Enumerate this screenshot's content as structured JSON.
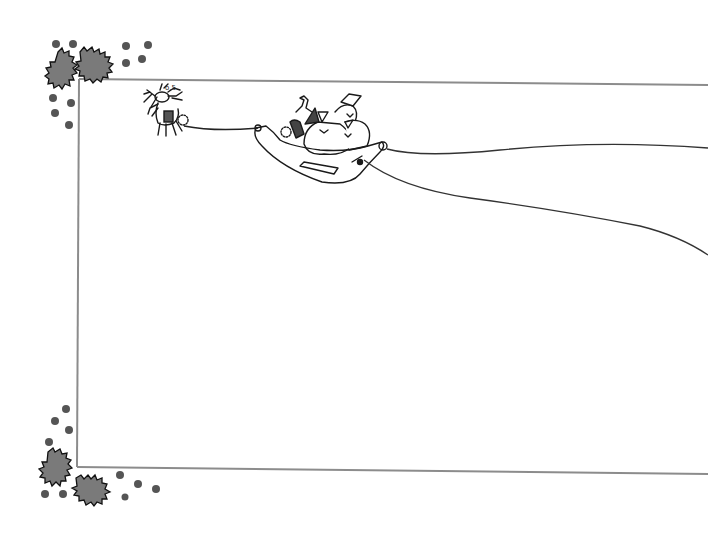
{
  "scene": {
    "title": "",
    "description_visible_text": [],
    "background": "#ffffff",
    "frame": {
      "stroke_color": "#8c8c8c",
      "top_left": [
        79,
        79
      ],
      "top_right": [
        708,
        85
      ],
      "bottom_left": [
        77,
        467
      ],
      "bottom_right": [
        708,
        474
      ]
    },
    "holly_color": "#7a7a7a",
    "berry_color": "#555555",
    "ink_color": "#1a1a1a",
    "elements": [
      {
        "name": "holly-corner-top-left",
        "kind": "holly"
      },
      {
        "name": "holly-corner-bottom-left",
        "kind": "holly"
      },
      {
        "name": "reindeer",
        "kind": "line-art"
      },
      {
        "name": "sleigh-with-santa-and-gift-sacks",
        "kind": "line-art"
      },
      {
        "name": "sleigh-trail-lines",
        "kind": "line-art"
      }
    ]
  }
}
